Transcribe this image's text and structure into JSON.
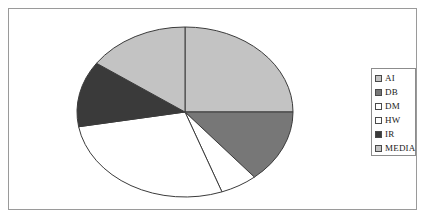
{
  "chart_data": {
    "type": "pie",
    "title": "",
    "categories": [
      "AI",
      "DB",
      "DM",
      "HW",
      "IR",
      "MEDIA"
    ],
    "values": [
      25,
      14,
      5.5,
      28,
      12.5,
      15
    ],
    "unit": "percent",
    "legend_position": "right",
    "grid": false,
    "start_angle_deg": 0,
    "direction": "clockwise",
    "slices": [
      {
        "label": "AI",
        "value": 25,
        "sweep_deg": 90,
        "color": "#c3c3c3",
        "swatch": "#c3c3c3"
      },
      {
        "label": "DB",
        "value": 14,
        "sweep_deg": 50,
        "color": "#777777",
        "swatch": "#777777"
      },
      {
        "label": "DM",
        "value": 5.5,
        "sweep_deg": 20,
        "color": "#ffffff",
        "swatch": "#ffffff"
      },
      {
        "label": "HW",
        "value": 28,
        "sweep_deg": 100,
        "color": "#ffffff",
        "swatch": "#ffffff"
      },
      {
        "label": "IR",
        "value": 12.5,
        "sweep_deg": 45,
        "color": "#3a3a3a",
        "swatch": "#3a3a3a"
      },
      {
        "label": "MEDIA",
        "value": 15,
        "sweep_deg": 55,
        "color": "#c3c3c3",
        "swatch": "#c3c3c3"
      }
    ]
  },
  "legend": {
    "items": [
      {
        "label": "AI"
      },
      {
        "label": "DB"
      },
      {
        "label": "DM"
      },
      {
        "label": "HW"
      },
      {
        "label": "IR"
      },
      {
        "label": "MEDIA"
      }
    ]
  },
  "style": {
    "frame_color": "#9a9a9a",
    "outline_color": "#3b3b3b",
    "background": "#ffffff"
  }
}
